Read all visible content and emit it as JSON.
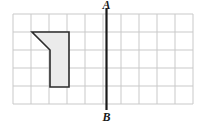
{
  "figure": {
    "background_color": "#ffffff",
    "width": 206,
    "height": 123,
    "grid": {
      "name": "coordinate-grid",
      "columns": 10,
      "rows": 5,
      "cell_size": 18,
      "origin_x": 13,
      "origin_y": 14,
      "line_color": "#c9c9c9",
      "border_color": "#c9c9c9",
      "line_width": 1
    },
    "shape": {
      "name": "shaded-polygon",
      "description": "Five-sided shaded figure resembling a flag or banner",
      "fill_color": "#ebebeb",
      "stroke_color": "#2b2b2b",
      "stroke_width": 1.6,
      "vertices": [
        {
          "x": 32,
          "y": 32
        },
        {
          "x": 69,
          "y": 32
        },
        {
          "x": 69,
          "y": 87
        },
        {
          "x": 50,
          "y": 87
        },
        {
          "x": 50,
          "y": 50
        }
      ],
      "grid_vertices": [
        {
          "col": 1,
          "row": 1
        },
        {
          "col": 3,
          "row": 1
        },
        {
          "col": 3,
          "row": 4
        },
        {
          "col": 2,
          "row": 4
        },
        {
          "col": 2,
          "row": 2
        }
      ]
    },
    "line": {
      "name": "line-of-reflection-ab",
      "color": "#1a1a1a",
      "width": 2.2,
      "x": 106.5,
      "y_top": 8,
      "y_bottom": 110
    },
    "labels": [
      {
        "id": "label-a",
        "text": "A",
        "x": 106.5,
        "y": 9,
        "anchor": "middle",
        "position": "top"
      },
      {
        "id": "label-b",
        "text": "B",
        "x": 106.5,
        "y": 121,
        "anchor": "middle",
        "position": "bottom"
      }
    ]
  }
}
